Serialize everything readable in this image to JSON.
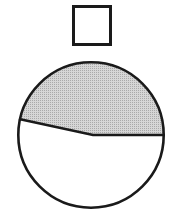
{
  "figure": {
    "title": "Shaded circle fraction diagram with unit square",
    "background_color": "#ffffff",
    "stroke_color": "#1a1a1a",
    "shade_color": "#c9c9c9",
    "shade_pattern": "halftone-dots",
    "canvas": {
      "width": 176,
      "height": 218
    },
    "shapes": {
      "unit_square": {
        "label": "unit-square",
        "x": 72,
        "y": 5,
        "width": 40,
        "height": 41,
        "stroke_width": 3,
        "fill": "#ffffff",
        "stroke": "#1a1a1a"
      },
      "circle": {
        "label": "divided-circle",
        "center_x": 91,
        "center_y": 135,
        "radius": 74,
        "stroke_width": 2.6,
        "fill": "#ffffff",
        "stroke": "#1a1a1a"
      },
      "shaded_region": {
        "label": "shaded-upper-region",
        "fill": "#c9c9c9",
        "description": "upper region of circle above the divider polyline",
        "path": "M 17.6 130.5 L 19 119 L 93 135 L 165 135 A 74 74 0 0 0 17.6 130.5 Z"
      },
      "divider_line": {
        "label": "divider-polyline",
        "stroke_width": 2.6,
        "stroke": "#1a1a1a",
        "points": [
          {
            "x": 19,
            "y": 119
          },
          {
            "x": 93,
            "y": 135
          },
          {
            "x": 165,
            "y": 135
          }
        ]
      }
    }
  }
}
